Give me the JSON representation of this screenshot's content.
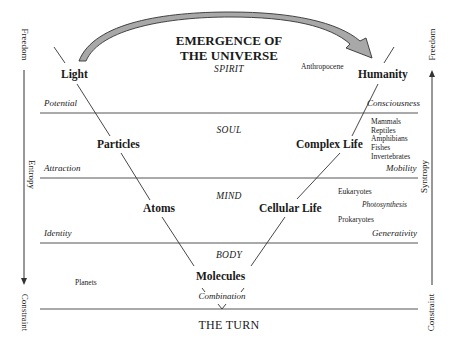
{
  "title": {
    "line1": "EMERGENCE OF",
    "line2": "THE UNIVERSE"
  },
  "levels": {
    "spirit": "SPIRIT",
    "soul": "SOUL",
    "mind": "MIND",
    "body": "BODY",
    "combination": "Combination"
  },
  "left_branch": {
    "nodes": [
      "Light",
      "Particles",
      "Atoms"
    ],
    "qualities": [
      "Potential",
      "Attraction",
      "Identity"
    ]
  },
  "bottom_node": "Molecules",
  "right_branch": {
    "nodes": [
      "Humanity",
      "Complex Life",
      "Cellular Life"
    ],
    "qualities": [
      "Consciousness",
      "Mobility",
      "Generativity"
    ]
  },
  "annotations": {
    "anthropocene": "Anthropocene",
    "complex_life_list": [
      "Mammals",
      "Reptiles",
      "Amphibians",
      "Fishes",
      "Invertebrates"
    ],
    "eukaryotes": "Eukaryotes",
    "photosynthesis": "Photosynthesis",
    "prokaryotes": "Prokaryotes",
    "planets": "Planets"
  },
  "left_axis": {
    "top": "Freedom",
    "middle": "Entropy",
    "bottom": "Constraint"
  },
  "right_axis": {
    "top": "Freedom",
    "middle": "Syntropy",
    "bottom": "Constraint"
  },
  "footer": "THE TURN",
  "colors": {
    "line": "#555555",
    "arrow_fill": "#a8a8a8",
    "arrow_stroke": "#333333",
    "text": "#1a1a1a"
  }
}
